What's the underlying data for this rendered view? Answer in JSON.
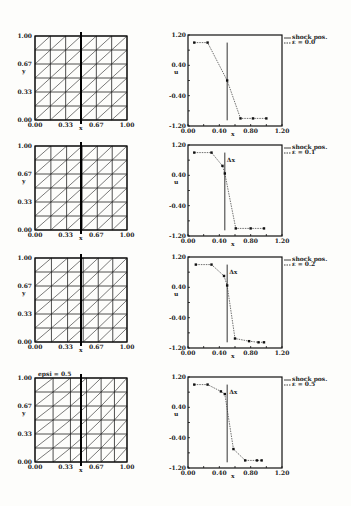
{
  "chart_data": [
    {
      "type": "mesh",
      "panel": 1,
      "xlabel": "x",
      "ylabel": "y",
      "xticks": [
        "0.00",
        "0.33",
        "0.67",
        "1.00"
      ],
      "yticks": [
        "0.00",
        "0.33",
        "0.67",
        "1.00"
      ],
      "grid": {
        "cols": 6,
        "rows": 6,
        "diagonals": true
      },
      "annotation": "",
      "distortion": 0
    },
    {
      "type": "line",
      "panel": 1,
      "title": "",
      "xlabel": "x",
      "ylabel": "u",
      "xticks": [
        "0.00",
        "0.40",
        "0.80",
        "1.20"
      ],
      "yticks": [
        "-1.20",
        "-0.40",
        "0.40",
        "1.20"
      ],
      "xlim": [
        0,
        1.2
      ],
      "ylim": [
        -1.2,
        1.2
      ],
      "legend": [
        "shock pos.",
        "ε = 0.0"
      ],
      "shock_x": 0.5,
      "annotation": "",
      "series": [
        {
          "name": "ε = 0.0",
          "x": [
            0.08,
            0.25,
            0.5,
            0.67,
            0.83,
            1.0
          ],
          "y": [
            1.0,
            1.0,
            0.0,
            -1.0,
            -1.0,
            -1.0
          ]
        }
      ]
    },
    {
      "type": "mesh",
      "panel": 2,
      "xlabel": "x",
      "ylabel": "y",
      "xticks": [
        "0.00",
        "0.33",
        "0.67",
        "1.00"
      ],
      "yticks": [
        "0.00",
        "0.33",
        "0.67",
        "1.00"
      ],
      "grid": {
        "cols": 6,
        "rows": 6,
        "diagonals": true
      },
      "annotation": "",
      "distortion": 0.1
    },
    {
      "type": "line",
      "panel": 2,
      "xlabel": "x",
      "ylabel": "u",
      "xticks": [
        "0.00",
        "0.40",
        "0.80",
        "1.20"
      ],
      "yticks": [
        "-1.20",
        "-0.40",
        "0.40",
        "1.20"
      ],
      "xlim": [
        0,
        1.2
      ],
      "ylim": [
        -1.2,
        1.2
      ],
      "legend": [
        "shock pos.",
        "ε = 0.1"
      ],
      "shock_x": 0.47,
      "annotation": "Δx",
      "series": [
        {
          "name": "ε = 0.1",
          "x": [
            0.08,
            0.3,
            0.44,
            0.47,
            0.61,
            0.8,
            0.97
          ],
          "y": [
            1.0,
            1.0,
            0.65,
            0.45,
            -1.0,
            -1.0,
            -1.0
          ]
        }
      ]
    },
    {
      "type": "mesh",
      "panel": 3,
      "xlabel": "x",
      "ylabel": "y",
      "xticks": [
        "0.00",
        "0.33",
        "0.67",
        "1.00"
      ],
      "yticks": [
        "0.00",
        "0.33",
        "0.67",
        "1.00"
      ],
      "grid": {
        "cols": 6,
        "rows": 6,
        "diagonals": true
      },
      "annotation": "",
      "distortion": 0.2
    },
    {
      "type": "line",
      "panel": 3,
      "xlabel": "x",
      "ylabel": "u",
      "xticks": [
        "0.00",
        "0.40",
        "0.80",
        "1.20"
      ],
      "yticks": [
        "-1.20",
        "-0.40",
        "0.40",
        "1.20"
      ],
      "xlim": [
        0,
        1.2
      ],
      "ylim": [
        -1.2,
        1.2
      ],
      "legend": [
        "shock pos.",
        "ε = 0.2"
      ],
      "shock_x": 0.5,
      "annotation": "Δx",
      "series": [
        {
          "name": "ε = 0.2",
          "x": [
            0.1,
            0.3,
            0.46,
            0.5,
            0.6,
            0.78,
            0.9,
            0.97
          ],
          "y": [
            1.0,
            1.0,
            0.7,
            0.45,
            -0.95,
            -1.02,
            -1.05,
            -1.05
          ]
        }
      ]
    },
    {
      "type": "mesh",
      "panel": 4,
      "xlabel": "x",
      "ylabel": "y",
      "xticks": [
        "0.00",
        "0.33",
        "0.67",
        "1.00"
      ],
      "yticks": [
        "0.00",
        "0.33",
        "0.67",
        "1.00"
      ],
      "grid": {
        "cols": 6,
        "rows": 6,
        "diagonals": true
      },
      "annotation": "epsi = 0.5",
      "distortion": 0.5
    },
    {
      "type": "line",
      "panel": 4,
      "xlabel": "x",
      "ylabel": "u",
      "xticks": [
        "0.00",
        "0.40",
        "0.80",
        "1.20"
      ],
      "yticks": [
        "-1.20",
        "-0.40",
        "0.40",
        "1.20"
      ],
      "xlim": [
        0,
        1.2
      ],
      "ylim": [
        -1.2,
        1.2
      ],
      "legend": [
        "shock pos.",
        "ε = 0.5"
      ],
      "shock_x": 0.5,
      "annotation": "Δx",
      "series": [
        {
          "name": "ε = 0.5",
          "x": [
            0.08,
            0.25,
            0.42,
            0.47,
            0.58,
            0.73,
            0.88,
            0.94
          ],
          "y": [
            1.0,
            1.0,
            0.82,
            0.75,
            -0.7,
            -1.0,
            -1.0,
            -1.0
          ]
        }
      ]
    }
  ],
  "layout": {
    "panel_tops": [
      36,
      146,
      258,
      378
    ]
  }
}
